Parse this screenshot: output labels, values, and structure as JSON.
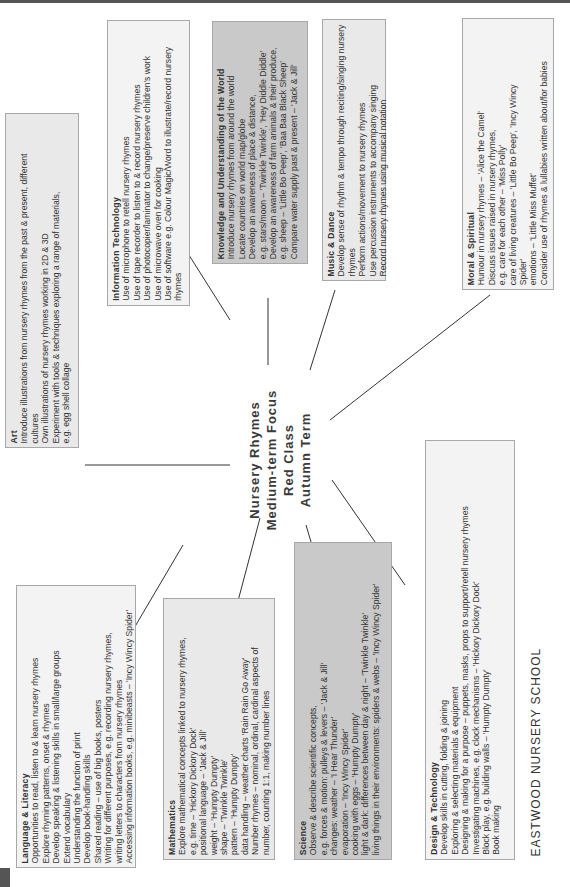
{
  "center": {
    "lines": [
      "Nursery Rhymes",
      "Medium-term Focus",
      "Red Class",
      "Autumn Term"
    ]
  },
  "school": "EASTWOOD NURSERY SCHOOL",
  "boxes": {
    "language": {
      "title": "Language & Literacy",
      "lines": [
        "Opportunities to read, listen to & learn nursery rhymes",
        "Explore rhyming patterns, onset & rhymes",
        "Develop speaking & listening skills in small/large groups",
        "Extend vocabulary",
        "Understanding the function of print",
        "Develop book-handling skills",
        "Shared reading – use of big books, posters",
        "Writing for different purposes, e.g. recording nursery rhymes,",
        "writing letters to characters from nursery rhymes",
        "Accessing information books, e.g. minibeasts – 'Incy Wincy Spider'"
      ]
    },
    "art": {
      "title": "Art",
      "lines": [
        "Introduce illustrations from nursery rhymes from the past & present, different",
        "cultures",
        "Own illustrations of nursery rhymes working in 2D & 3D",
        "Experiment with tools & techniques exploring a range of materials,",
        "e.g. egg shell collage"
      ]
    },
    "it": {
      "title": "Information Technology",
      "lines": [
        "Use of microphone to retell nursery rhymes",
        "Use of tape recorder to listen to & record nursery rhymes",
        "Use of photocopier/laminator to change/preserve children's work",
        "Use of microwave oven for cooking",
        "Use of software e.g. Colour Magic/Word to illustrate/record nursery",
        "rhymes"
      ]
    },
    "knowledge": {
      "title": "Knowledge and Understanding of the World",
      "lines": [
        "Introduce nursery rhymes from around the world",
        "Locate countries on world map/globe",
        "Develop an awareness of place & distance,",
        "e.g. stars/moon – 'Twinkle Twinkle', 'Hey Diddle Diddle'",
        "Develop an awareness of farm animals & their produce,",
        "e.g. sheep – 'Little Bo Peep', 'Baa Baa Black Sheep'",
        "Compare water supply past & present – 'Jack & Jill'"
      ]
    },
    "music": {
      "title": "Music & Dance",
      "lines": [
        "Develop sense of rhythm & tempo through reciting/singing nursery",
        "rhymes",
        "Perform actions/movement to nursery rhymes",
        "Use percussion instruments to accompany singing",
        "Record nursery rhymes using musical notation"
      ]
    },
    "moral": {
      "title": "Moral & Spiritual",
      "lines": [
        "Humour in nursery rhymes – 'Alice the Camel'",
        "Discuss issues raised in nursery rhymes,",
        "e.g. care for each other – 'Miss Polly'",
        "care of living creatures – 'Little Bo Peep', 'Incy Wincy",
        "Spider'",
        "emotions – 'Little Miss Muffet'",
        "Consider use of rhymes & lullabies written about/for babies"
      ]
    },
    "maths": {
      "title": "Mathematics",
      "lines": [
        "Explore mathematical concepts linked to nursery rhymes,",
        "e.g. time – 'Hickory Dickory Dock'",
        "   positional language – 'Jack & Jill'",
        "   weight – 'Humpty Dumpty'",
        "   shape – 'Twinkle Twinkle'",
        "   pattern – 'Humpty Dumpty'",
        "   data handling – weather charts 'Rain Rain Go Away'",
        "Number rhymes – nominal, ordinal, cardinal aspects of",
        "number, counting 1:1, making number lines"
      ]
    },
    "science": {
      "title": "Science",
      "lines": [
        "Observe & describe scientific concepts,",
        "e.g. forces & motion: pulleys & levers – 'Jack & Jill'",
        "   changes: weather – 'I Hear Thunder'",
        "   evaporation – 'Incy Wincy Spider'",
        "   cooking with eggs – 'Humpty Dumpty'",
        "   light & dark: differences between day & night – 'Twinkle Twinkle'",
        "   living things in their environments: spiders & webs – 'Incy Wincy Spider'"
      ]
    },
    "design": {
      "title": "Design & Technology",
      "lines": [
        "Develop skills in cutting, folding & joining",
        "Exploring & selecting materials & equipment",
        "Designing & making for a purpose – puppets, masks, props to support/retell nursery rhymes",
        "Investigating machines, e.g. clock mechanisms – 'Hickory Dickory Dock'",
        "Block play, e.g. building walls – 'Humpty Dumpty'",
        "Book making"
      ]
    }
  }
}
